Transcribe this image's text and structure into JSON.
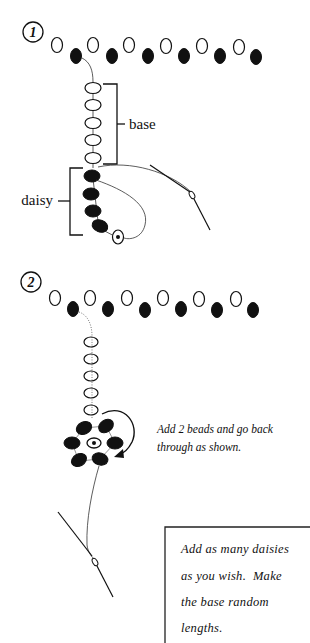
{
  "step1": {
    "number": "1",
    "labels": {
      "base": "base",
      "daisy": "daisy"
    }
  },
  "step2": {
    "number": "2",
    "caption_lines": [
      "Add 2 beads and go back",
      "through as shown."
    ]
  },
  "note_box": {
    "lines": [
      "Add as many daisies",
      "as you wish.  Make",
      "the base random",
      "lengths."
    ]
  },
  "colors": {
    "ink": "#111111",
    "background": "#ffffff"
  }
}
